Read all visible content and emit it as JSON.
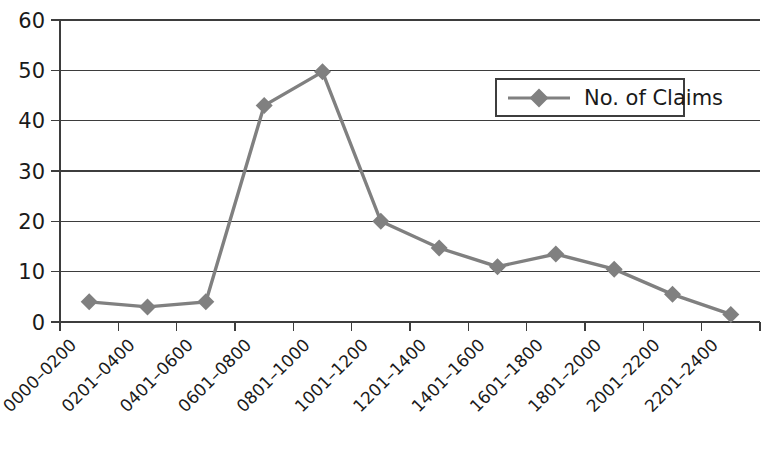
{
  "chart_data": {
    "type": "line",
    "title": "",
    "xlabel": "",
    "ylabel": "",
    "categories": [
      "0000–0200",
      "0201–0400",
      "0401–0600",
      "0601–0800",
      "0801–1000",
      "1001–1200",
      "1201–1400",
      "1401–1600",
      "1601–1800",
      "1801–2000",
      "2001–2200",
      "2201–2400"
    ],
    "series": [
      {
        "name": "No. of Claims",
        "values": [
          4,
          3,
          4,
          43,
          49.7,
          20,
          14.7,
          11,
          13.5,
          10.5,
          5.5,
          1.5
        ],
        "color": "#808080",
        "marker": "diamond"
      }
    ],
    "ylim": [
      0,
      60
    ],
    "yticks": [
      0,
      10,
      20,
      30,
      40,
      50,
      60
    ],
    "ytick_labels": [
      "0",
      "10",
      "20",
      "30",
      "40",
      "50",
      "60"
    ],
    "grid": "horizontal",
    "legend_position": "upper-right",
    "legend_entries": [
      "No. of Claims"
    ],
    "axis_color": "#3d3d3d",
    "background": "#ffffff"
  },
  "legend": {
    "entry_label": "No. of Claims",
    "marker_icon": "diamond-marker-icon"
  },
  "plot_geometry": {
    "left": 60,
    "right": 760,
    "top": 20,
    "bottom": 322
  }
}
